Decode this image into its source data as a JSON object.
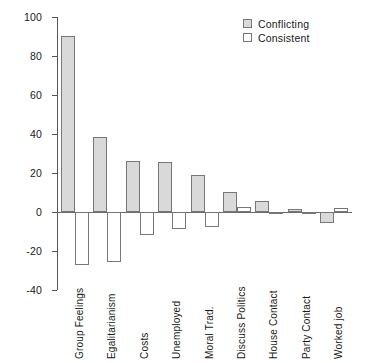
{
  "chart_data": {
    "type": "bar",
    "title": "",
    "subtitle": "",
    "xlabel": "",
    "ylabel": "Percent Change",
    "ylim": [
      -40,
      100
    ],
    "ytick_labels": [
      "100",
      "80",
      "60",
      "40",
      "20",
      "0",
      "-20",
      "-40"
    ],
    "yticks": [
      100,
      80,
      60,
      40,
      20,
      0,
      -20,
      -40
    ],
    "grid": false,
    "legend_position": "top-right",
    "categories": [
      "Group Feelings",
      "Egalitarianism",
      "Costs",
      "Unemployed",
      "Moral Trad.",
      "Discuss Politics",
      "House Contact",
      "Party Contact",
      "Worked job"
    ],
    "series": [
      {
        "name": "Conflicting",
        "color": "#d9d9d9",
        "values": [
          90.5,
          38.5,
          26.0,
          25.5,
          19.0,
          10.5,
          5.5,
          1.5,
          -5.5
        ]
      },
      {
        "name": "Consistent",
        "color": "#ffffff",
        "values": [
          -27.0,
          -25.5,
          -12.0,
          -8.5,
          -7.5,
          2.5,
          -0.5,
          -0.5,
          2.0
        ]
      }
    ]
  },
  "legend": {
    "items": [
      {
        "label": "Conflicting",
        "swatch": "conflicting"
      },
      {
        "label": "Consistent",
        "swatch": "consistent"
      }
    ]
  },
  "axis": {
    "y_title": "Percent Change"
  }
}
